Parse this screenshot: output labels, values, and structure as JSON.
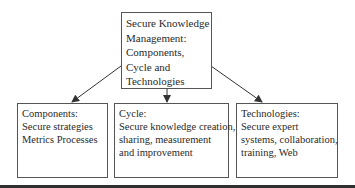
{
  "diagram": {
    "root": {
      "lines": [
        "Secure Knowledge",
        "Management:",
        "Components,",
        "Cycle and",
        "Technologies"
      ]
    },
    "children": [
      {
        "title": "Components:",
        "lines": [
          "Secure strategies",
          "Metrics Processes"
        ]
      },
      {
        "title": "Cycle:",
        "lines": [
          "Secure knowledge creation,",
          "sharing, measurement",
          "and improvement"
        ]
      },
      {
        "title": "Technologies:",
        "lines": [
          "Secure expert",
          "systems, collaboration,",
          "training, Web"
        ]
      }
    ],
    "edges": [
      {
        "from": "root",
        "to": "children.0"
      },
      {
        "from": "root",
        "to": "children.1"
      },
      {
        "from": "root",
        "to": "children.2"
      }
    ],
    "colors": {
      "border": "#555555",
      "arrow": "#333333",
      "text": "#2a2a2a",
      "bottom_bar": "#2f2f2f"
    }
  }
}
